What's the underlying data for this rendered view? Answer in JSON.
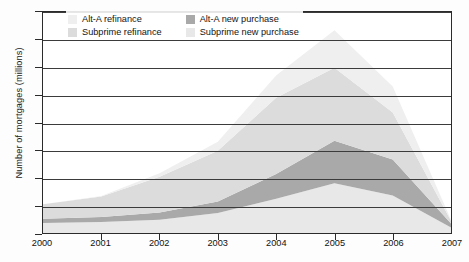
{
  "chart_data": {
    "type": "area",
    "stacked": true,
    "title": "",
    "subtitle": "",
    "xlabel": "",
    "ylabel": "Number of mortgages (millions)",
    "x": [
      2000,
      2001,
      2002,
      2003,
      2004,
      2005,
      2006,
      2007
    ],
    "categories": [
      "2000",
      "2001",
      "2002",
      "2003",
      "2004",
      "2005",
      "2006",
      "2007"
    ],
    "xlim": [
      2000,
      2007
    ],
    "ylim": [
      0,
      4.0
    ],
    "yticks": [
      0,
      0.5,
      1.0,
      1.5,
      2.0,
      2.5,
      3.0,
      3.5,
      4.0
    ],
    "ytick_labels": [
      "0",
      "0.5",
      "1.0",
      "1.5",
      "2.0",
      "2.5",
      "3.0",
      "3.5",
      "4.0"
    ],
    "xticks": [
      2000,
      2001,
      2002,
      2003,
      2004,
      2005,
      2006,
      2007
    ],
    "xtick_labels": [
      "2000",
      "2001",
      "2002",
      "2003",
      "2004",
      "2005",
      "2006",
      "2007"
    ],
    "grid": true,
    "grid_axis": "y",
    "legend_position": "top-left-inside",
    "legend_columns": 2,
    "stack_order_bottom_to_top": [
      "Subprime new purchase",
      "Alt-A new purchase",
      "Subprime refinance",
      "Alt-A refinance"
    ],
    "series": [
      {
        "name": "Subprime new purchase",
        "color": "#e8e8e8",
        "values": [
          0.18,
          0.2,
          0.24,
          0.36,
          0.62,
          0.9,
          0.68,
          0.1
        ]
      },
      {
        "name": "Alt-A new purchase",
        "color": "#a9a9a9",
        "values": [
          0.08,
          0.09,
          0.13,
          0.21,
          0.45,
          0.77,
          0.65,
          0.07
        ]
      },
      {
        "name": "Subprime refinance",
        "color": "#dcdcdc",
        "values": [
          0.26,
          0.37,
          0.65,
          0.92,
          1.38,
          1.32,
          0.85,
          0.05
        ]
      },
      {
        "name": "Alt-A refinance",
        "color": "#efefef",
        "values": [
          0.0,
          0.01,
          0.06,
          0.16,
          0.4,
          0.68,
          0.47,
          0.02
        ]
      }
    ],
    "cumulative_totals": [
      0.52,
      0.67,
      1.08,
      1.65,
      2.85,
      3.67,
      2.65,
      0.24
    ],
    "peak_year": "2005",
    "peak_total": 3.67
  },
  "legend": {
    "items": [
      {
        "label": "Alt-A refinance",
        "color": "#efefef"
      },
      {
        "label": "Alt-A new purchase",
        "color": "#a9a9a9"
      },
      {
        "label": "Subprime refinance",
        "color": "#dcdcdc"
      },
      {
        "label": "Subprime new purchase",
        "color": "#e8e8e8"
      }
    ]
  },
  "axes": {
    "y_title": "Number of mortgages (millions)"
  },
  "colors": {
    "axis": "#2b2b2b",
    "grid": "#3b3b3b",
    "text": "#111111",
    "background": "#ffffff"
  }
}
